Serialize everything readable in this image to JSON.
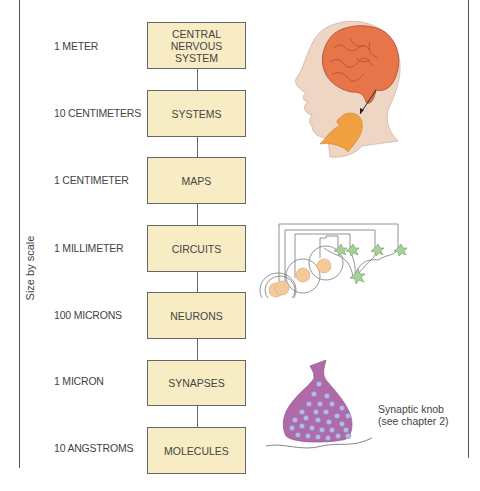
{
  "axis": {
    "label": "Size by scale"
  },
  "levels": [
    {
      "scale": "1 METER",
      "name": "CENTRAL NERVOUS SYSTEM",
      "name_lines": [
        "CENTRAL",
        "NERVOUS",
        "SYSTEM"
      ]
    },
    {
      "scale": "10 CENTIMETERS",
      "name": "SYSTEMS"
    },
    {
      "scale": "1 CENTIMETER",
      "name": "MAPS"
    },
    {
      "scale": "1 MILLIMETER",
      "name": "CIRCUITS"
    },
    {
      "scale": "100 MICRONS",
      "name": "NEURONS"
    },
    {
      "scale": "1 MICRON",
      "name": "SYNAPSES"
    },
    {
      "scale": "10 ANGSTROMS",
      "name": "MOLECULES"
    }
  ],
  "illustrations": {
    "head": "head-with-brain-and-vocal-tract",
    "circuit": "neural-circuit",
    "synapse": "synaptic-knob"
  },
  "caption": {
    "line1": "Synaptic knob",
    "line2": "(see chapter 2)"
  },
  "colors": {
    "box_fill": "#f8ecc4",
    "head_skin": "#eed5c4",
    "brain": "#e8754a",
    "vocal": "#f0a040",
    "neuron_green": "#a8d09a",
    "cell_body": "#f6c99a",
    "synapse_purple": "#b06aa8",
    "vesicle": "#b8b8e8"
  }
}
